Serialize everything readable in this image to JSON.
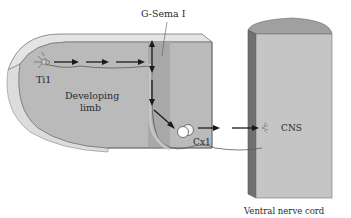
{
  "labels": {
    "gsema": "G-Sema I",
    "ti1": "Ti1",
    "limb_line1": "Developing",
    "limb_line2": "limb",
    "cx1": "Cx1",
    "cns": "CNS",
    "nerve_cord": "Ventral nerve cord"
  },
  "colors": {
    "limb_face": "#b9b9b9",
    "limb_top": "#e2e2e2",
    "limb_rim": "#dcdcdc",
    "band": "#a9a9a9",
    "cord_face": "#c4c4c4",
    "cord_top": "#9f9f9f",
    "cord_side": "#6f6f6f",
    "arrow": "#1a1a1a",
    "axon": "#555555"
  }
}
